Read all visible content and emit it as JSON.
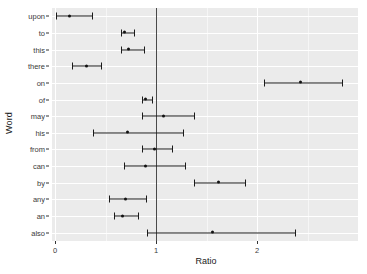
{
  "chart_data": {
    "type": "scatter",
    "plot_style": "forest-plot",
    "title": "",
    "xlabel": "Ratio",
    "ylabel": "Word",
    "xlim": [
      -0.03,
      3.0
    ],
    "xticks": [
      0,
      1,
      2
    ],
    "xtick_labels": [
      "0",
      "1",
      "2"
    ],
    "grid": true,
    "reference_line": 1,
    "legend": "none",
    "categories": [
      "upon",
      "to",
      "this",
      "there",
      "on",
      "of",
      "may",
      "his",
      "from",
      "can",
      "by",
      "any",
      "an",
      "also"
    ],
    "series": [
      {
        "name": "Ratio estimate with confidence interval",
        "points": [
          {
            "word": "upon",
            "estimate": 0.14,
            "low": 0.01,
            "high": 0.37
          },
          {
            "word": "to",
            "estimate": 0.69,
            "low": 0.65,
            "high": 0.78
          },
          {
            "word": "this",
            "estimate": 0.73,
            "low": 0.65,
            "high": 0.88
          },
          {
            "word": "there",
            "estimate": 0.31,
            "low": 0.17,
            "high": 0.46
          },
          {
            "word": "on",
            "estimate": 2.43,
            "low": 2.07,
            "high": 2.84
          },
          {
            "word": "of",
            "estimate": 0.9,
            "low": 0.86,
            "high": 0.96
          },
          {
            "word": "may",
            "estimate": 1.07,
            "low": 0.86,
            "high": 1.38
          },
          {
            "word": "his",
            "estimate": 0.72,
            "low": 0.38,
            "high": 1.27
          },
          {
            "word": "from",
            "estimate": 0.98,
            "low": 0.86,
            "high": 1.16
          },
          {
            "word": "can",
            "estimate": 0.9,
            "low": 0.68,
            "high": 1.29
          },
          {
            "word": "by",
            "estimate": 1.62,
            "low": 1.38,
            "high": 1.88
          },
          {
            "word": "any",
            "estimate": 0.7,
            "low": 0.53,
            "high": 0.9
          },
          {
            "word": "an",
            "estimate": 0.67,
            "low": 0.58,
            "high": 0.82
          },
          {
            "word": "also",
            "estimate": 1.56,
            "low": 0.91,
            "high": 2.38
          }
        ]
      }
    ]
  },
  "axes": {
    "y_title": "Word",
    "x_title": "Ratio"
  },
  "colors": {
    "panel_background": "#ebebeb",
    "gridline_major": "#ffffff",
    "gridline_minor": "#f6f6f6",
    "point_color": "#111111",
    "reference_line": "#4a4a4a",
    "text_color": "#3a3a3a"
  }
}
